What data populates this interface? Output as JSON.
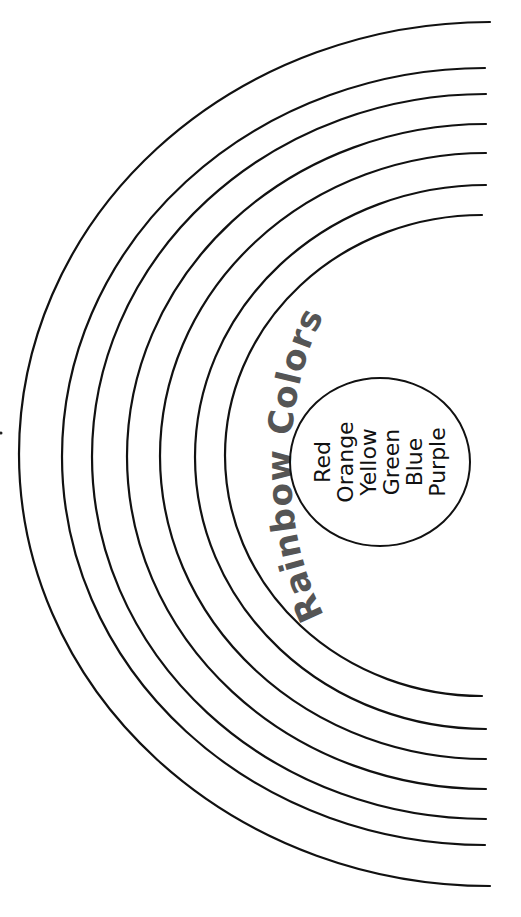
{
  "page": {
    "title": "Rainbow Colors",
    "colors": [
      "Red",
      "Orange",
      "Yellow",
      "Green",
      "Blue",
      "Purple"
    ]
  },
  "style": {
    "line_color": "#111111",
    "title_color": "#555555",
    "background": "#ffffff"
  },
  "arcs": [
    {
      "top": 22,
      "bottom": 886,
      "left": 19,
      "right": 490
    },
    {
      "top": 68,
      "bottom": 845,
      "left": 62,
      "right": 485
    },
    {
      "top": 94,
      "bottom": 819,
      "left": 92,
      "right": 486
    },
    {
      "top": 124,
      "bottom": 789,
      "left": 127,
      "right": 486
    },
    {
      "top": 153,
      "bottom": 759,
      "left": 160,
      "right": 486
    },
    {
      "top": 185,
      "bottom": 729,
      "left": 195,
      "right": 486
    },
    {
      "top": 215,
      "bottom": 696,
      "left": 225,
      "right": 482
    }
  ]
}
